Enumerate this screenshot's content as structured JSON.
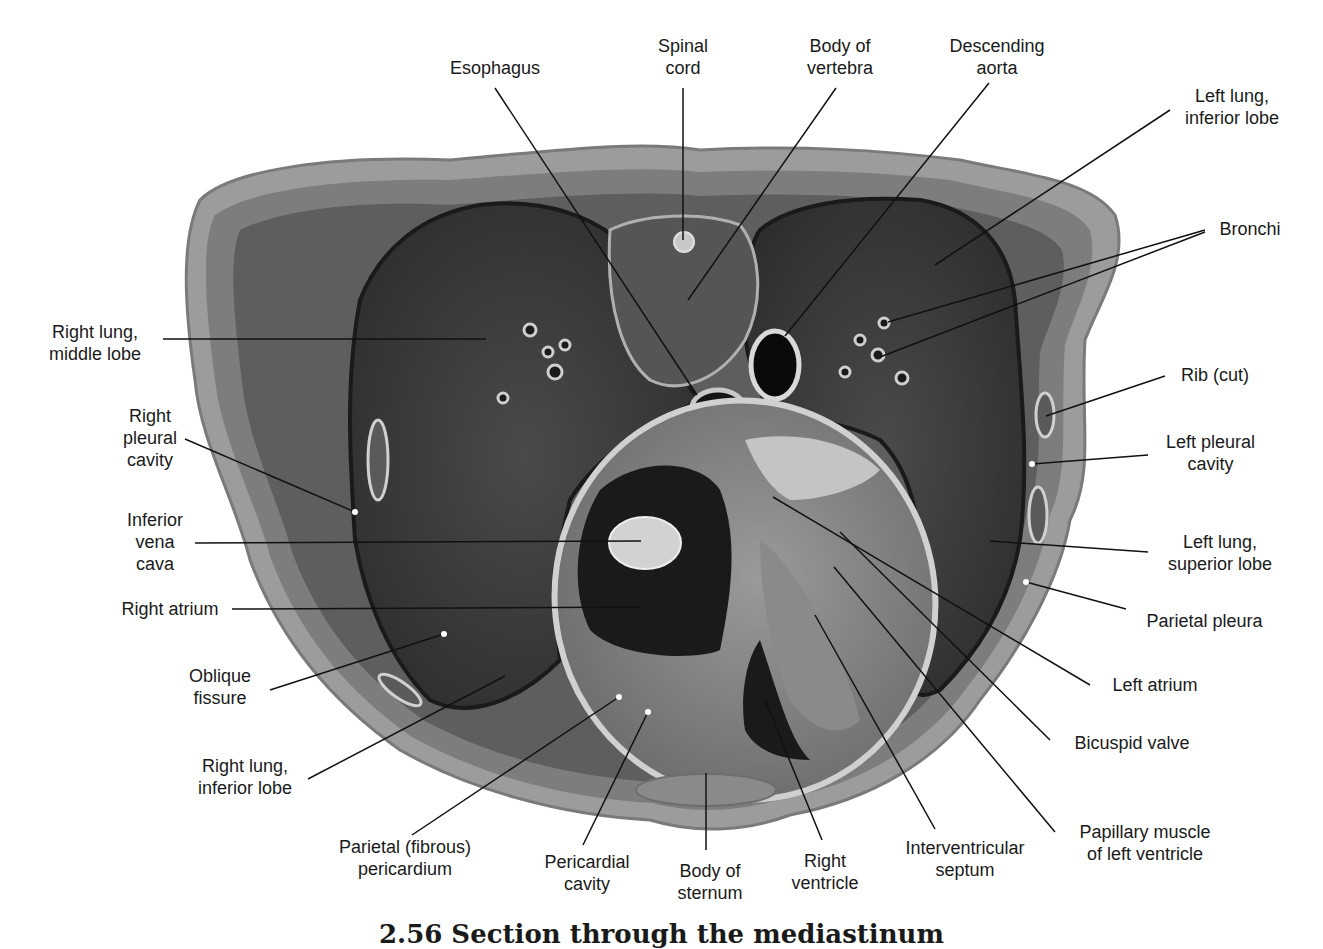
{
  "figure": {
    "caption": "2.56 Section through the mediastinum",
    "colors": {
      "background": "#ffffff",
      "text": "#1a1a1a",
      "leader_dark": "#111111",
      "leader_light": "#f2f2f2"
    }
  },
  "labels": {
    "esophagus": "Esophagus",
    "spinal_cord": "Spinal\ncord",
    "body_of_vertebra": "Body of\nvertebra",
    "descending_aorta": "Descending\naorta",
    "left_lung_inferior_lobe": "Left lung,\ninferior lobe",
    "bronchi": "Bronchi",
    "right_lung_middle_lobe": "Right lung,\nmiddle lobe",
    "rib_cut": "Rib (cut)",
    "right_pleural_cavity": "Right\npleural\ncavity",
    "left_pleural_cavity": "Left pleural\ncavity",
    "inferior_vena_cava": "Inferior\nvena\ncava",
    "left_lung_superior_lobe": "Left lung,\nsuperior lobe",
    "right_atrium": "Right atrium",
    "parietal_pleura": "Parietal pleura",
    "oblique_fissure": "Oblique\nfissure",
    "left_atrium": "Left atrium",
    "bicuspid_valve": "Bicuspid valve",
    "right_lung_inferior_lobe": "Right lung,\ninferior lobe",
    "parietal_fibrous_pericardium": "Parietal (fibrous)\npericardium",
    "pericardial_cavity": "Pericardial\ncavity",
    "body_of_sternum": "Body of\nsternum",
    "right_ventricle": "Right\nventricle",
    "interventricular_septum": "Interventricular\nseptum",
    "papillary_muscle": "Papillary muscle\nof left ventricle"
  }
}
